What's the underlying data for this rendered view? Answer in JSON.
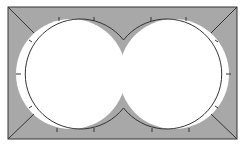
{
  "diagram": {
    "colors": {
      "shade": "#a8a8a8",
      "stroke": "#333333",
      "background": "#ffffff"
    },
    "rect": {
      "x": 8,
      "y": 7,
      "w": 229,
      "h": 132
    },
    "circles": [
      {
        "cx": 71,
        "cy": 74,
        "r": 55
      },
      {
        "cx": 174,
        "cy": 74,
        "r": 55
      }
    ],
    "corner_lines": 4,
    "tick_marks_per_circle": 7
  }
}
